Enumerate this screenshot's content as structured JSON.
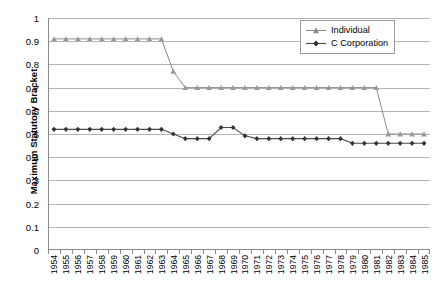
{
  "chart_data": {
    "type": "line",
    "title": "",
    "xlabel": "",
    "ylabel": "Maximum Statutory Bracket",
    "ylim": [
      0,
      1
    ],
    "ytick_labels": [
      "0",
      "0.1",
      "0.2",
      "0.3",
      "0.4",
      "0.5",
      "0.6",
      "0.7",
      "0.8",
      "0.9",
      "1"
    ],
    "ytick_values": [
      0,
      0.1,
      0.2,
      0.3,
      0.4,
      0.5,
      0.6,
      0.7,
      0.8,
      0.9,
      1
    ],
    "grid": true,
    "legend_position": "top-right",
    "categories": [
      "1954",
      "1955",
      "1956",
      "1957",
      "1958",
      "1959",
      "1960",
      "1961",
      "1962",
      "1963",
      "1964",
      "1965",
      "1966",
      "1967",
      "1968",
      "1969",
      "1970",
      "1971",
      "1972",
      "1973",
      "1974",
      "1975",
      "1976",
      "1977",
      "1978",
      "1979",
      "1980",
      "1981",
      "1982",
      "1983",
      "1984",
      "1985"
    ],
    "series": [
      {
        "name": "Individual",
        "marker": "triangle",
        "color": "#8c8c8c",
        "values": [
          0.91,
          0.91,
          0.91,
          0.91,
          0.91,
          0.91,
          0.91,
          0.91,
          0.91,
          0.91,
          0.77,
          0.7,
          0.7,
          0.7,
          0.7,
          0.7,
          0.7,
          0.7,
          0.7,
          0.7,
          0.7,
          0.7,
          0.7,
          0.7,
          0.7,
          0.7,
          0.7,
          0.7,
          0.5,
          0.5,
          0.5,
          0.5
        ]
      },
      {
        "name": "C Corporation",
        "marker": "diamond",
        "color": "#4a4a4a",
        "values": [
          0.52,
          0.52,
          0.52,
          0.52,
          0.52,
          0.52,
          0.52,
          0.52,
          0.52,
          0.52,
          0.5,
          0.48,
          0.48,
          0.48,
          0.528,
          0.528,
          0.492,
          0.48,
          0.48,
          0.48,
          0.48,
          0.48,
          0.48,
          0.48,
          0.48,
          0.46,
          0.46,
          0.46,
          0.46,
          0.46,
          0.46,
          0.46
        ]
      }
    ]
  },
  "legend": {
    "entries": [
      {
        "label": "Individual"
      },
      {
        "label": "C Corporation"
      }
    ]
  },
  "caption": {
    "text": ""
  },
  "colors": {
    "individual": "#8c8c8c",
    "c_corporation": "#4a4a4a",
    "gridline": "#b3b3b3",
    "axis": "#8a8a8a"
  }
}
